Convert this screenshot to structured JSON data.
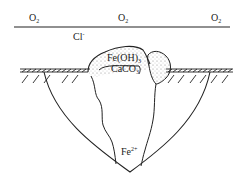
{
  "diagram": {
    "labels": {
      "o2_left": "O",
      "o2_mid": "O",
      "o2_right": "O",
      "o2_subscript": "2",
      "chloride": "Cl",
      "chloride_charge": "-",
      "fe_oh_prefix": "Fe(OH)",
      "fe_oh_subscript": "3",
      "caco_prefix": "CaCO",
      "caco_subscript": "3",
      "ferrous": "Fe",
      "ferrous_charge": "2+"
    },
    "colors": {
      "line": "#222222",
      "background": "#ffffff",
      "stipple": "#777777"
    }
  }
}
